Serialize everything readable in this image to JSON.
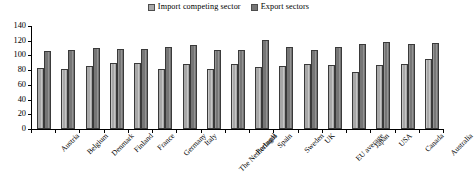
{
  "chart_data": {
    "type": "bar",
    "title": "",
    "subtitle": "",
    "xlabel": "",
    "ylabel": "",
    "ylim": [
      0,
      140
    ],
    "yticks": [
      0,
      20,
      40,
      60,
      80,
      100,
      120,
      140
    ],
    "grid": false,
    "legend_position": "top-center",
    "categories": [
      "Austria",
      "Belgium",
      "Denmark",
      "Finland",
      "France",
      "Germany",
      "Italy",
      "The Netherlands",
      "Portugal",
      "Spain",
      "Sweden",
      "UK",
      "EU average",
      "Japan",
      "USA",
      "Canada",
      "Australia"
    ],
    "series": [
      {
        "name": "Import competing sector",
        "color": "#a8a8a8",
        "values": [
          83,
          82,
          86,
          90,
          90,
          82,
          89,
          82,
          88,
          84,
          86,
          89,
          87,
          78,
          87,
          89,
          95
        ]
      },
      {
        "name": "Export sectors",
        "color": "#767676",
        "values": [
          106,
          108,
          110,
          109,
          109,
          111,
          114,
          107,
          107,
          121,
          111,
          108,
          112,
          116,
          118,
          116,
          117
        ]
      }
    ]
  }
}
